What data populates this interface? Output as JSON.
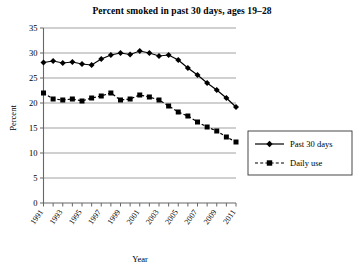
{
  "chart_data": {
    "type": "line",
    "title": "Percent smoked in past 30 days, ages 19–28",
    "xlabel": "Year",
    "ylabel": "Percent",
    "ylim": [
      0,
      35
    ],
    "ytick_step": 5,
    "yticks": [
      0,
      5,
      10,
      15,
      20,
      25,
      30,
      35
    ],
    "grid": true,
    "grid_axis": "y",
    "legend_position": "right",
    "xlim": [
      1991,
      2011
    ],
    "x": [
      1991,
      1992,
      1993,
      1994,
      1995,
      1996,
      1997,
      1998,
      1999,
      2000,
      2001,
      2002,
      2003,
      2004,
      2005,
      2006,
      2007,
      2008,
      2009,
      2010,
      2011
    ],
    "xtick_labels": [
      "1991",
      "1993",
      "1995",
      "1997",
      "1999",
      "2001",
      "2003",
      "2005",
      "2007",
      "2009",
      "2011"
    ],
    "xtick_label_years": [
      1991,
      1993,
      1995,
      1997,
      1999,
      2001,
      2003,
      2005,
      2007,
      2009,
      2011
    ],
    "series": [
      {
        "name": "Past 30 days",
        "marker": "diamond",
        "linestyle": "solid",
        "color": "#000000",
        "values": [
          28.1,
          28.4,
          28.0,
          28.2,
          27.8,
          27.6,
          28.8,
          29.6,
          30.0,
          29.7,
          30.4,
          30.0,
          29.4,
          29.6,
          28.6,
          27.0,
          25.6,
          24.0,
          22.6,
          21.0,
          19.2
        ]
      },
      {
        "name": "Daily use",
        "marker": "square",
        "linestyle": "dashed",
        "color": "#000000",
        "values": [
          22.0,
          20.8,
          20.6,
          20.8,
          20.4,
          21.0,
          21.4,
          22.0,
          20.6,
          20.8,
          21.6,
          21.2,
          20.6,
          19.4,
          18.2,
          17.4,
          16.2,
          15.2,
          14.4,
          13.2,
          12.2
        ]
      }
    ]
  },
  "legend": {
    "items": [
      {
        "label": "Past 30 days",
        "marker": "diamond",
        "linestyle": "solid"
      },
      {
        "label": "Daily use",
        "marker": "square",
        "linestyle": "dashed"
      }
    ]
  }
}
